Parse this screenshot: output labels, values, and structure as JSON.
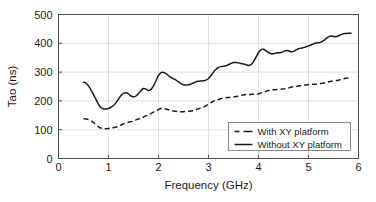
{
  "chart_data": {
    "type": "line",
    "title": "",
    "xlabel": "Frequency (GHz)",
    "ylabel": "Tao (ns)",
    "xlim": [
      0,
      6
    ],
    "ylim": [
      0,
      500
    ],
    "xticks": [
      0,
      1,
      2,
      3,
      4,
      5,
      6
    ],
    "xtick_labels": [
      "0",
      "1",
      "2",
      "3",
      "4",
      "5",
      "6"
    ],
    "yticks": [
      0,
      100,
      200,
      300,
      400,
      500
    ],
    "ytick_labels": [
      "0",
      "100",
      "200",
      "300",
      "400",
      "500"
    ],
    "grid": true,
    "legend_position": "lower right",
    "series": [
      {
        "name": "With XY platform",
        "style": "dashed",
        "color": "#1a1a1a",
        "x": [
          0.5,
          0.58,
          0.65,
          0.72,
          0.8,
          0.88,
          0.95,
          1.02,
          1.1,
          1.18,
          1.25,
          1.32,
          1.4,
          1.48,
          1.55,
          1.62,
          1.7,
          1.78,
          1.85,
          1.92,
          2.0,
          2.08,
          2.15,
          2.22,
          2.3,
          2.38,
          2.45,
          2.52,
          2.6,
          2.68,
          2.75,
          2.82,
          2.9,
          2.98,
          3.05,
          3.12,
          3.2,
          3.28,
          3.35,
          3.42,
          3.5,
          3.58,
          3.65,
          3.72,
          3.8,
          3.88,
          3.95,
          4.02,
          4.1,
          4.18,
          4.25,
          4.32,
          4.4,
          4.48,
          4.55,
          4.62,
          4.7,
          4.78,
          4.85,
          4.92,
          5.0,
          5.08,
          5.15,
          5.22,
          5.3,
          5.38,
          5.45,
          5.52,
          5.6,
          5.68,
          5.75,
          5.85
        ],
        "y": [
          138,
          136,
          131,
          122,
          110,
          104,
          103,
          105,
          107,
          110,
          116,
          122,
          126,
          129,
          134,
          139,
          144,
          150,
          156,
          163,
          170,
          175,
          172,
          168,
          165,
          163,
          162,
          163,
          164,
          166,
          170,
          174,
          179,
          186,
          194,
          200,
          205,
          209,
          211,
          212,
          214,
          216,
          219,
          221,
          222,
          223,
          223,
          226,
          231,
          235,
          238,
          239,
          240,
          241,
          243,
          246,
          249,
          251,
          253,
          255,
          257,
          258,
          258,
          259,
          262,
          265,
          268,
          270,
          272,
          276,
          279,
          280
        ]
      },
      {
        "name": "Without XY platform",
        "style": "solid",
        "color": "#1a1a1a",
        "x": [
          0.5,
          0.55,
          0.6,
          0.65,
          0.7,
          0.75,
          0.8,
          0.85,
          0.9,
          0.95,
          1.0,
          1.05,
          1.1,
          1.15,
          1.2,
          1.25,
          1.3,
          1.35,
          1.4,
          1.45,
          1.5,
          1.55,
          1.6,
          1.65,
          1.7,
          1.75,
          1.8,
          1.85,
          1.9,
          1.95,
          2.0,
          2.05,
          2.1,
          2.15,
          2.2,
          2.25,
          2.3,
          2.35,
          2.4,
          2.45,
          2.5,
          2.55,
          2.6,
          2.65,
          2.7,
          2.75,
          2.8,
          2.85,
          2.9,
          2.95,
          3.0,
          3.05,
          3.1,
          3.15,
          3.2,
          3.25,
          3.3,
          3.35,
          3.4,
          3.45,
          3.5,
          3.55,
          3.6,
          3.65,
          3.7,
          3.75,
          3.8,
          3.85,
          3.9,
          3.95,
          4.0,
          4.05,
          4.1,
          4.15,
          4.2,
          4.25,
          4.3,
          4.35,
          4.4,
          4.45,
          4.5,
          4.55,
          4.6,
          4.65,
          4.7,
          4.75,
          4.8,
          4.85,
          4.9,
          4.95,
          5.0,
          5.05,
          5.1,
          5.15,
          5.2,
          5.25,
          5.3,
          5.35,
          5.4,
          5.45,
          5.5,
          5.55,
          5.6,
          5.65,
          5.7,
          5.75,
          5.8,
          5.85
        ],
        "y": [
          265,
          262,
          252,
          238,
          222,
          205,
          188,
          176,
          172,
          172,
          174,
          178,
          184,
          194,
          206,
          219,
          226,
          228,
          224,
          217,
          214,
          217,
          226,
          236,
          243,
          241,
          236,
          240,
          252,
          270,
          288,
          298,
          299,
          295,
          288,
          282,
          277,
          272,
          266,
          260,
          256,
          255,
          256,
          259,
          262,
          266,
          268,
          269,
          270,
          272,
          278,
          288,
          300,
          310,
          316,
          319,
          320,
          322,
          326,
          330,
          333,
          333,
          332,
          330,
          328,
          326,
          323,
          326,
          336,
          352,
          368,
          378,
          379,
          374,
          368,
          364,
          364,
          366,
          367,
          368,
          372,
          375,
          374,
          371,
          372,
          377,
          381,
          383,
          385,
          388,
          391,
          394,
          398,
          401,
          402,
          404,
          409,
          416,
          422,
          425,
          424,
          423,
          426,
          430,
          433,
          434,
          435,
          435
        ]
      }
    ]
  },
  "legend": {
    "items": [
      {
        "label": "With XY platform",
        "style": "dashed"
      },
      {
        "label": "Without XY platform",
        "style": "solid"
      }
    ]
  }
}
